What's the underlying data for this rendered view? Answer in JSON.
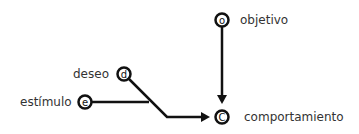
{
  "diagram": {
    "nodes": [
      {
        "id": "o",
        "letter": "o",
        "label": "objetivo"
      },
      {
        "id": "d",
        "letter": "d",
        "label": "deseo"
      },
      {
        "id": "e",
        "letter": "e",
        "label": "estímulo"
      },
      {
        "id": "c",
        "letter": "C",
        "label": "comportamiento"
      }
    ],
    "edges": [
      {
        "from": "o",
        "to": "c"
      },
      {
        "from": "d",
        "to": "c"
      },
      {
        "from": "e",
        "to": "c"
      }
    ],
    "colors": {
      "stroke": "#111111",
      "text": "#333333",
      "background": "#ffffff"
    }
  }
}
